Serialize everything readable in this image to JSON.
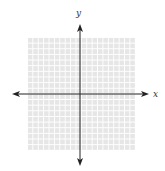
{
  "diagram": {
    "type": "coordinate-plane",
    "axes": {
      "x_label": "x",
      "y_label": "y",
      "color": "#222222"
    },
    "grid": {
      "columns": 20,
      "rows": 20,
      "cell_color": "#e6e6e6",
      "line_color": "#ffffff"
    }
  }
}
